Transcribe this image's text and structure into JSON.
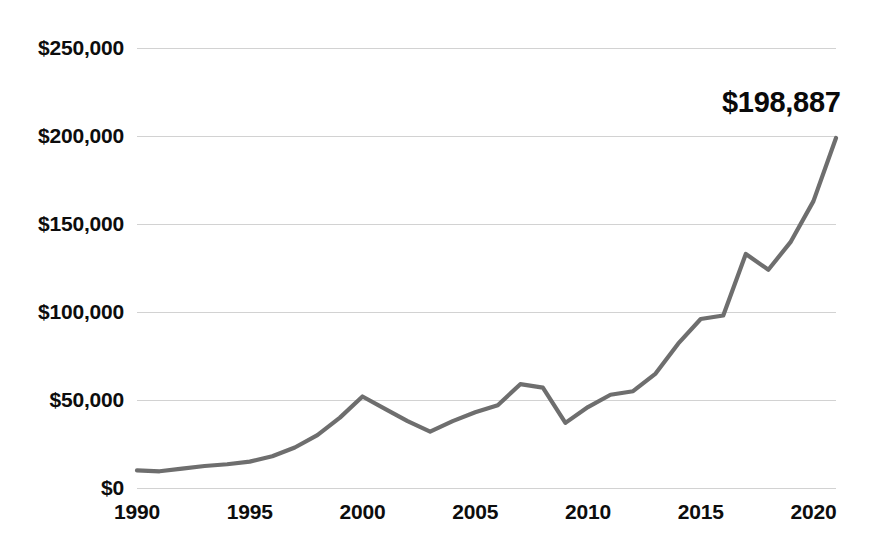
{
  "chart_data": {
    "type": "line",
    "title": "",
    "subtitle": "",
    "xlabel": "",
    "ylabel": "",
    "xlim": [
      1990,
      2021
    ],
    "ylim": [
      0,
      250000
    ],
    "grid": true,
    "legend": false,
    "legend_position": "none",
    "line_color": "#6e6e6e",
    "x_tick_labels": [
      "1990",
      "1995",
      "2000",
      "2005",
      "2010",
      "2015",
      "2020"
    ],
    "x_ticks": [
      1990,
      1995,
      2000,
      2005,
      2010,
      2015,
      2020
    ],
    "y_tick_labels": [
      "$0",
      "$50,000",
      "$100,000",
      "$150,000",
      "$200,000",
      "$250,000"
    ],
    "y_ticks": [
      0,
      50000,
      100000,
      150000,
      200000,
      250000
    ],
    "annotations": [
      {
        "text": "$198,887",
        "x": 2021,
        "y": 198887
      }
    ],
    "x": [
      1990,
      1991,
      1992,
      1993,
      1994,
      1995,
      1996,
      1997,
      1998,
      1999,
      2000,
      2001,
      2002,
      2003,
      2004,
      2005,
      2006,
      2007,
      2008,
      2009,
      2010,
      2011,
      2012,
      2013,
      2014,
      2015,
      2016,
      2017,
      2018,
      2019,
      2020,
      2021
    ],
    "values": [
      10000,
      9500,
      11000,
      12500,
      13500,
      15000,
      18000,
      23000,
      30000,
      40000,
      52000,
      45000,
      38000,
      32000,
      38000,
      43000,
      47000,
      59000,
      57000,
      37000,
      46000,
      53000,
      55000,
      65000,
      82000,
      96000,
      98000,
      133000,
      124000,
      140000,
      163000,
      198887
    ],
    "series": [
      {
        "name": "value",
        "values": [
          10000,
          9500,
          11000,
          12500,
          13500,
          15000,
          18000,
          23000,
          30000,
          40000,
          52000,
          45000,
          38000,
          32000,
          38000,
          43000,
          47000,
          59000,
          57000,
          37000,
          46000,
          53000,
          55000,
          65000,
          82000,
          96000,
          98000,
          133000,
          124000,
          140000,
          163000,
          198887
        ]
      }
    ]
  }
}
